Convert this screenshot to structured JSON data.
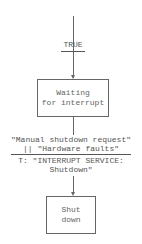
{
  "diagram": {
    "type": "state-flow",
    "entry_transition": {
      "condition": "TRUE"
    },
    "states": [
      {
        "id": "waiting",
        "label_line1": "Waiting",
        "label_line2": "for interrupt"
      },
      {
        "id": "shutdown",
        "label_line1": "Shut",
        "label_line2": "down"
      }
    ],
    "transition": {
      "condition_line1": "\"Manual shutdown request\"",
      "condition_line2": "|| \"Hardware faults\"",
      "action_line1": "T: \"INTERRUPT SERVICE:",
      "action_line2": "Shutdown\""
    },
    "colors": {
      "line": "#666666",
      "text": "#555555",
      "background": "#ffffff"
    }
  }
}
